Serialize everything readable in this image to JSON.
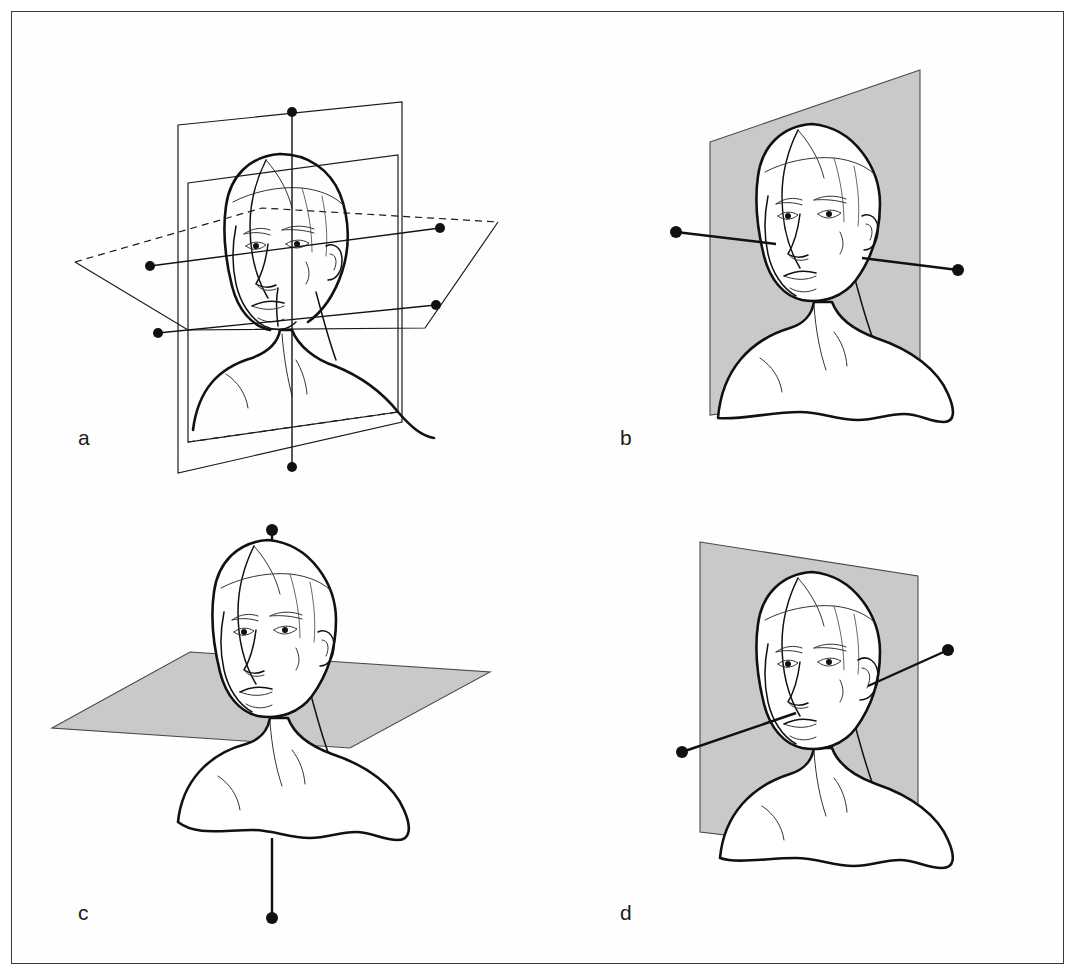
{
  "figure": {
    "kind": "anatomical-planes-illustration",
    "background_color": "#ffffff",
    "frame_color": "#3a3a3a",
    "line_color": "#111111",
    "plane_fill_color": "#c9c9c9"
  },
  "panels": [
    {
      "id": "a",
      "label": "a",
      "description": "head and bust with all three anatomical planes intersecting",
      "planes": [
        "median sagittal plane",
        "coronal plane",
        "transverse plane"
      ],
      "plane_style": "outline",
      "axes": [
        "vertical axis",
        "sagittal axis",
        "transverse axis"
      ],
      "axis_dot_count": 6
    },
    {
      "id": "b",
      "label": "b",
      "description": "head and bust with the coronal (frontal) plane shown shaded",
      "planes": [
        "coronal plane"
      ],
      "plane_style": "shaded",
      "axes": [
        "transverse axis"
      ],
      "axis_dot_count": 2
    },
    {
      "id": "c",
      "label": "c",
      "description": "head and bust with the transverse (horizontal) plane shown shaded",
      "planes": [
        "transverse plane"
      ],
      "plane_style": "shaded",
      "axes": [
        "vertical axis"
      ],
      "axis_dot_count": 2
    },
    {
      "id": "d",
      "label": "d",
      "description": "head and bust with the median sagittal plane shown shaded",
      "planes": [
        "median sagittal plane"
      ],
      "plane_style": "shaded",
      "axes": [
        "sagittal axis"
      ],
      "axis_dot_count": 2
    }
  ]
}
